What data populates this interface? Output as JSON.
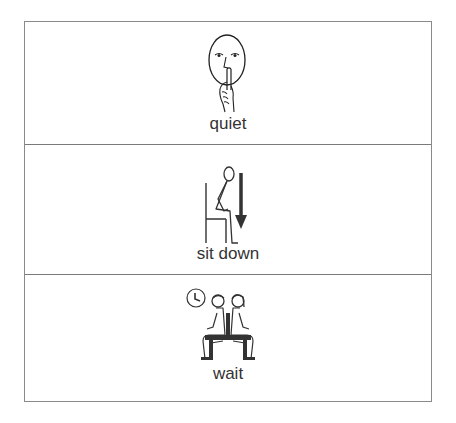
{
  "board": {
    "border_color": "#8a8a8a",
    "cells": [
      {
        "label": "quiet",
        "icon": "quiet-face-finger-on-lips-icon"
      },
      {
        "label": "sit down",
        "icon": "person-sitting-down-arrow-icon"
      },
      {
        "label": "wait",
        "icon": "two-people-on-bench-clock-icon"
      }
    ]
  }
}
